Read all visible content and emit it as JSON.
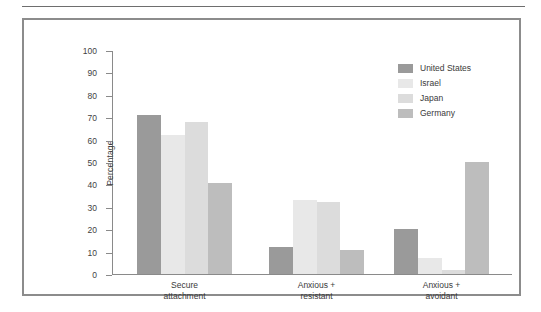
{
  "chart_data": {
    "type": "bar",
    "title": "",
    "subtitle": "",
    "xlabel": "",
    "ylabel": "Percentage",
    "ylim": [
      0,
      100
    ],
    "yticks": [
      0,
      10,
      20,
      30,
      40,
      50,
      60,
      70,
      80,
      90,
      100
    ],
    "grid": false,
    "legend_position": "top-right",
    "categories": [
      "Secure attachment",
      "Anxious + resistant",
      "Anxious + avoidant"
    ],
    "category_lines": [
      [
        "Secure",
        "attachment"
      ],
      [
        "Anxious +",
        "resistant"
      ],
      [
        "Anxious +",
        "avoidant"
      ]
    ],
    "series": [
      {
        "name": "United States",
        "color": "#9a9a9a",
        "values": [
          71,
          12,
          20
        ]
      },
      {
        "name": "Israel",
        "color": "#e8e8e8",
        "values": [
          62,
          33,
          7
        ]
      },
      {
        "name": "Japan",
        "color": "#dcdcdc",
        "values": [
          68,
          32,
          2
        ]
      },
      {
        "name": "Germany",
        "color": "#bdbdbd",
        "values": [
          40.5,
          10.5,
          50
        ]
      }
    ]
  },
  "figure": {
    "frame_color": "#8c8c8c",
    "axis_color": "#8a8a8a",
    "text_color": "#3a3a3a"
  }
}
